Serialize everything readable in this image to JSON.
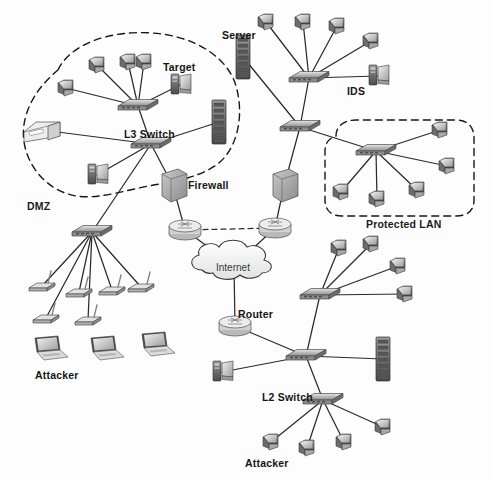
{
  "diagram": {
    "background_color": "#fdfdfd",
    "link_color": "#2b2b2b",
    "zone_border_color": "#1a1a1a",
    "zones": [
      {
        "id": "dmz",
        "label": "DMZ",
        "style": "dashed-blob",
        "label_x": 27,
        "label_y": 200
      },
      {
        "id": "protected-lan",
        "label": "Protected LAN",
        "style": "dashed-rounded",
        "label_x": 366,
        "label_y": 218
      }
    ],
    "labels": [
      {
        "id": "target",
        "text": "Target",
        "x": 163,
        "y": 61
      },
      {
        "id": "server",
        "text": "Server",
        "x": 222,
        "y": 29
      },
      {
        "id": "ids",
        "text": "IDS",
        "x": 347,
        "y": 85
      },
      {
        "id": "l3-switch",
        "text": "L3 Switch",
        "x": 124,
        "y": 128
      },
      {
        "id": "firewall",
        "text": "Firewall",
        "x": 188,
        "y": 179
      },
      {
        "id": "internet",
        "text": "Internet",
        "x": 216,
        "y": 262
      },
      {
        "id": "router",
        "text": "Router",
        "x": 238,
        "y": 308
      },
      {
        "id": "l2-switch",
        "text": "L2 Switch",
        "x": 262,
        "y": 391
      },
      {
        "id": "attacker-wireless",
        "text": "Attacker",
        "x": 35,
        "y": 369
      },
      {
        "id": "attacker-lan",
        "text": "Attacker",
        "x": 245,
        "y": 457
      }
    ],
    "devices": [
      {
        "id": "dmz-pc-1",
        "kind": "workstation",
        "x": 66,
        "y": 88
      },
      {
        "id": "dmz-pc-2",
        "kind": "workstation",
        "x": 97,
        "y": 65
      },
      {
        "id": "dmz-pc-3",
        "kind": "workstation",
        "x": 128,
        "y": 62
      },
      {
        "id": "dmz-pc-4",
        "kind": "workstation",
        "x": 144,
        "y": 62
      },
      {
        "id": "dmz-target-server",
        "kind": "tower-pc",
        "x": 180,
        "y": 85
      },
      {
        "id": "dmz-printer",
        "kind": "printer",
        "x": 42,
        "y": 130
      },
      {
        "id": "dmz-rack",
        "kind": "rack",
        "x": 219,
        "y": 122
      },
      {
        "id": "dmz-monitor-pc",
        "kind": "tower-pc",
        "x": 97,
        "y": 175
      },
      {
        "id": "l3-switch-upper",
        "kind": "switch",
        "x": 138,
        "y": 106
      },
      {
        "id": "l3-switch-lower",
        "kind": "switch",
        "x": 151,
        "y": 144
      },
      {
        "id": "core-pc-1",
        "kind": "workstation",
        "x": 266,
        "y": 22
      },
      {
        "id": "core-pc-2",
        "kind": "workstation",
        "x": 303,
        "y": 22
      },
      {
        "id": "core-pc-3",
        "kind": "workstation",
        "x": 337,
        "y": 26
      },
      {
        "id": "core-pc-4",
        "kind": "workstation",
        "x": 371,
        "y": 41
      },
      {
        "id": "core-switch",
        "kind": "switch",
        "x": 309,
        "y": 78
      },
      {
        "id": "ids-host",
        "kind": "tower-pc",
        "x": 378,
        "y": 76
      },
      {
        "id": "server-rack",
        "kind": "rack",
        "x": 243,
        "y": 57
      },
      {
        "id": "l3-switch-core",
        "kind": "switch",
        "x": 300,
        "y": 127
      },
      {
        "id": "lan-switch",
        "kind": "switch",
        "x": 376,
        "y": 151
      },
      {
        "id": "lan-pc-1",
        "kind": "workstation",
        "x": 440,
        "y": 130
      },
      {
        "id": "lan-pc-2",
        "kind": "workstation",
        "x": 447,
        "y": 166
      },
      {
        "id": "lan-pc-3",
        "kind": "workstation",
        "x": 341,
        "y": 192
      },
      {
        "id": "lan-pc-4",
        "kind": "workstation",
        "x": 377,
        "y": 199
      },
      {
        "id": "lan-pc-5",
        "kind": "workstation",
        "x": 417,
        "y": 190
      },
      {
        "id": "firewall-box-left",
        "kind": "firewall",
        "x": 173,
        "y": 186
      },
      {
        "id": "firewall-box-right",
        "kind": "firewall",
        "x": 284,
        "y": 186
      },
      {
        "id": "firewall-router-left",
        "kind": "router",
        "x": 185,
        "y": 230
      },
      {
        "id": "firewall-router-right",
        "kind": "router",
        "x": 275,
        "y": 228
      },
      {
        "id": "internet-cloud",
        "kind": "cloud",
        "x": 234,
        "y": 266
      },
      {
        "id": "edge-router",
        "kind": "router",
        "x": 235,
        "y": 326
      },
      {
        "id": "wireless-switch",
        "kind": "switch",
        "x": 92,
        "y": 232
      },
      {
        "id": "ap-1",
        "kind": "access-point",
        "x": 42,
        "y": 286
      },
      {
        "id": "ap-2",
        "kind": "access-point",
        "x": 46,
        "y": 318
      },
      {
        "id": "ap-3",
        "kind": "access-point",
        "x": 79,
        "y": 292
      },
      {
        "id": "ap-4",
        "kind": "access-point",
        "x": 88,
        "y": 320
      },
      {
        "id": "ap-5",
        "kind": "access-point",
        "x": 112,
        "y": 290
      },
      {
        "id": "ap-6",
        "kind": "access-point",
        "x": 141,
        "y": 287
      },
      {
        "id": "laptop-1",
        "kind": "laptop",
        "x": 48,
        "y": 348
      },
      {
        "id": "laptop-2",
        "kind": "laptop",
        "x": 104,
        "y": 348
      },
      {
        "id": "laptop-3",
        "kind": "laptop",
        "x": 155,
        "y": 344
      },
      {
        "id": "branch-switch",
        "kind": "switch",
        "x": 320,
        "y": 295
      },
      {
        "id": "branch-pc-1",
        "kind": "workstation",
        "x": 339,
        "y": 248
      },
      {
        "id": "branch-pc-2",
        "kind": "workstation",
        "x": 371,
        "y": 244
      },
      {
        "id": "branch-pc-3",
        "kind": "workstation",
        "x": 398,
        "y": 266
      },
      {
        "id": "branch-pc-4",
        "kind": "workstation",
        "x": 405,
        "y": 294
      },
      {
        "id": "l2-switch-node",
        "kind": "switch",
        "x": 306,
        "y": 356
      },
      {
        "id": "l2-rack",
        "kind": "rack",
        "x": 383,
        "y": 359
      },
      {
        "id": "l2-tower",
        "kind": "tower-pc",
        "x": 222,
        "y": 372
      },
      {
        "id": "l2-switch-lower",
        "kind": "switch",
        "x": 323,
        "y": 400
      },
      {
        "id": "att-pc-1",
        "kind": "workstation",
        "x": 271,
        "y": 442
      },
      {
        "id": "att-pc-2",
        "kind": "workstation",
        "x": 307,
        "y": 448
      },
      {
        "id": "att-pc-3",
        "kind": "workstation",
        "x": 344,
        "y": 442
      },
      {
        "id": "att-pc-4",
        "kind": "workstation",
        "x": 383,
        "y": 427
      }
    ],
    "links": [
      [
        "dmz-pc-1",
        "l3-switch-upper"
      ],
      [
        "dmz-pc-2",
        "l3-switch-upper"
      ],
      [
        "dmz-pc-3",
        "l3-switch-upper"
      ],
      [
        "dmz-pc-4",
        "l3-switch-upper"
      ],
      [
        "dmz-target-server",
        "l3-switch-upper"
      ],
      [
        "l3-switch-upper",
        "l3-switch-lower"
      ],
      [
        "dmz-printer",
        "l3-switch-lower"
      ],
      [
        "dmz-rack",
        "l3-switch-lower"
      ],
      [
        "dmz-monitor-pc",
        "l3-switch-lower"
      ],
      [
        "l3-switch-lower",
        "firewall-box-left"
      ],
      [
        "l3-switch-lower",
        "wireless-switch"
      ],
      [
        "core-pc-1",
        "core-switch"
      ],
      [
        "core-pc-2",
        "core-switch"
      ],
      [
        "core-pc-3",
        "core-switch"
      ],
      [
        "core-pc-4",
        "core-switch"
      ],
      [
        "ids-host",
        "core-switch"
      ],
      [
        "server-rack",
        "l3-switch-core"
      ],
      [
        "core-switch",
        "l3-switch-core"
      ],
      [
        "l3-switch-core",
        "lan-switch"
      ],
      [
        "l3-switch-core",
        "firewall-box-right"
      ],
      [
        "lan-switch",
        "lan-pc-1"
      ],
      [
        "lan-switch",
        "lan-pc-2"
      ],
      [
        "lan-switch",
        "lan-pc-3"
      ],
      [
        "lan-switch",
        "lan-pc-4"
      ],
      [
        "lan-switch",
        "lan-pc-5"
      ],
      [
        "firewall-box-left",
        "firewall-router-left"
      ],
      [
        "firewall-box-right",
        "firewall-router-right"
      ],
      [
        "firewall-router-left",
        "internet-cloud"
      ],
      [
        "firewall-router-right",
        "internet-cloud"
      ],
      [
        "internet-cloud",
        "edge-router"
      ],
      [
        "edge-router",
        "l2-switch-node"
      ],
      [
        "l2-switch-node",
        "branch-switch"
      ],
      [
        "branch-switch",
        "branch-pc-1"
      ],
      [
        "branch-switch",
        "branch-pc-2"
      ],
      [
        "branch-switch",
        "branch-pc-3"
      ],
      [
        "branch-switch",
        "branch-pc-4"
      ],
      [
        "l2-switch-node",
        "l2-rack"
      ],
      [
        "l2-switch-node",
        "l2-tower"
      ],
      [
        "l2-switch-node",
        "l2-switch-lower"
      ],
      [
        "l2-switch-lower",
        "att-pc-1"
      ],
      [
        "l2-switch-lower",
        "att-pc-2"
      ],
      [
        "l2-switch-lower",
        "att-pc-3"
      ],
      [
        "l2-switch-lower",
        "att-pc-4"
      ],
      [
        "wireless-switch",
        "ap-1"
      ],
      [
        "wireless-switch",
        "ap-2"
      ],
      [
        "wireless-switch",
        "ap-3"
      ],
      [
        "wireless-switch",
        "ap-4"
      ],
      [
        "wireless-switch",
        "ap-5"
      ],
      [
        "wireless-switch",
        "ap-6"
      ]
    ],
    "dashed_links": [
      [
        "firewall-router-left",
        "firewall-router-right"
      ]
    ]
  }
}
